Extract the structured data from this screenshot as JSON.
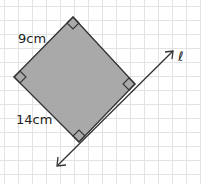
{
  "diagram": {
    "shape": "rectangle",
    "fill_color": "#a9a9a9",
    "stroke_color": "#333333",
    "side_labels": {
      "top_left": "9cm",
      "bottom_left": "14cm"
    },
    "line_label": "ℓ",
    "right_angle_markers": 4,
    "background": "grid"
  }
}
